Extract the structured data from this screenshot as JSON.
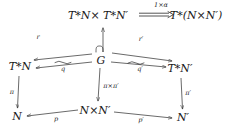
{
  "diagram": {
    "type": "commutative-diagram",
    "title": "",
    "background_color": "#ffffff",
    "stroke_color": "#2a2a2a",
    "text_color": "#1a1a1a",
    "nodes": [
      {
        "id": "TNxTN",
        "label": "T*N× T*N′",
        "x": 98,
        "y": 15
      },
      {
        "id": "TNN",
        "label": "T*(N×N′)",
        "x": 196,
        "y": 15
      },
      {
        "id": "TN",
        "label": "T*N",
        "x": 20,
        "y": 66
      },
      {
        "id": "G",
        "label": "G",
        "x": 101,
        "y": 60
      },
      {
        "id": "TNprime",
        "label": "T*N′",
        "x": 180,
        "y": 68
      },
      {
        "id": "N",
        "label": "N",
        "x": 17,
        "y": 116
      },
      {
        "id": "NxN",
        "label": "N×N′",
        "x": 95,
        "y": 110
      },
      {
        "id": "Nprime",
        "label": "N′",
        "x": 183,
        "y": 117
      }
    ],
    "edges": [
      {
        "id": "iso-top",
        "label": "1×α",
        "from": "TNxTN",
        "to": "TNN",
        "style": "double-iso",
        "label_x": 161,
        "label_y": 5
      },
      {
        "id": "r",
        "label": "r",
        "from": "G",
        "to": "TN",
        "style": "plain",
        "label_x": 38,
        "label_y": 37
      },
      {
        "id": "r-prime",
        "label": "r′",
        "from": "G",
        "to": "TNprime",
        "style": "plain",
        "label_x": 141,
        "label_y": 39
      },
      {
        "id": "inclusion",
        "label": "",
        "from": "G",
        "to": "TNxTN",
        "style": "hooked",
        "label_x": 0,
        "label_y": 0
      },
      {
        "id": "q",
        "label": "q",
        "from": "G",
        "to": "TN",
        "style": "tilde-over",
        "label_x": 63,
        "label_y": 69
      },
      {
        "id": "q-prime",
        "label": "q′",
        "from": "G",
        "to": "TNprime",
        "style": "tilde-over",
        "label_x": 140,
        "label_y": 69
      },
      {
        "id": "pi",
        "label": "π",
        "from": "TN",
        "to": "N",
        "style": "plain",
        "label_x": 12,
        "label_y": 92
      },
      {
        "id": "pi-times-pi",
        "label": "π×π′",
        "from": "G",
        "to": "NxN",
        "style": "plain",
        "label_x": 111,
        "label_y": 86
      },
      {
        "id": "pi-prime",
        "label": "π′",
        "from": "TNprime",
        "to": "Nprime",
        "style": "plain",
        "label_x": 188,
        "label_y": 93
      },
      {
        "id": "p",
        "label": "p",
        "from": "NxN",
        "to": "N",
        "style": "plain",
        "label_x": 56,
        "label_y": 119
      },
      {
        "id": "p-prime",
        "label": "p′",
        "from": "NxN",
        "to": "Nprime",
        "style": "plain",
        "label_x": 141,
        "label_y": 120
      }
    ]
  }
}
